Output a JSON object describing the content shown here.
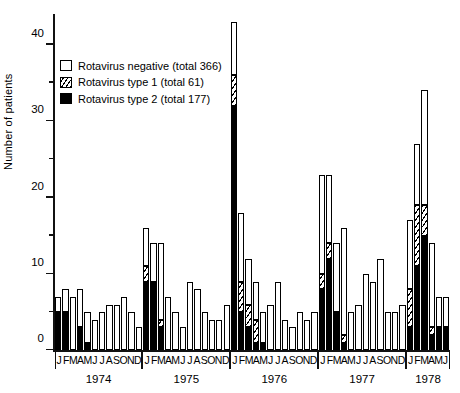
{
  "chart_data": {
    "type": "bar",
    "title": "",
    "stacked": true,
    "xlabel": "",
    "ylabel": "Number of patients",
    "ylim": [
      0,
      44
    ],
    "yticks_major": [
      0,
      10,
      20,
      30,
      40
    ],
    "yticks_minor": [
      5,
      15,
      25,
      35
    ],
    "grid": false,
    "legend_position": "upper-left",
    "month_letters": [
      "J",
      "F",
      "M",
      "A",
      "M",
      "J",
      "J",
      "A",
      "S",
      "O",
      "N",
      "D"
    ],
    "year_groups": [
      {
        "year": "1974",
        "months": [
          "J",
          "F",
          "M",
          "A",
          "M",
          "J",
          "J",
          "A",
          "S",
          "O",
          "N",
          "D"
        ]
      },
      {
        "year": "1975",
        "months": [
          "J",
          "F",
          "M",
          "A",
          "M",
          "J",
          "J",
          "A",
          "S",
          "O",
          "N",
          "D"
        ]
      },
      {
        "year": "1976",
        "months": [
          "J",
          "F",
          "M",
          "A",
          "M",
          "J",
          "J",
          "A",
          "S",
          "O",
          "N",
          "D"
        ]
      },
      {
        "year": "1977",
        "months": [
          "J",
          "F",
          "M",
          "A",
          "M",
          "J",
          "J",
          "A",
          "S",
          "O",
          "N",
          "D"
        ]
      },
      {
        "year": "1978",
        "months": [
          "J",
          "F",
          "M",
          "A",
          "M",
          "J"
        ]
      }
    ],
    "series": [
      {
        "name": "Rotavirus negative",
        "key": "neg",
        "color": "#ffffff",
        "total": 366
      },
      {
        "name": "Rotavirus type 1",
        "key": "t1",
        "color": "hatched",
        "total": 61
      },
      {
        "name": "Rotavirus type 2",
        "key": "t2",
        "color": "#000000",
        "total": 177
      }
    ],
    "x": [
      "1974-01",
      "1974-02",
      "1974-03",
      "1974-04",
      "1974-05",
      "1974-06",
      "1974-07",
      "1974-08",
      "1974-09",
      "1974-10",
      "1974-11",
      "1974-12",
      "1975-01",
      "1975-02",
      "1975-03",
      "1975-04",
      "1975-05",
      "1975-06",
      "1975-07",
      "1975-08",
      "1975-09",
      "1975-10",
      "1975-11",
      "1975-12",
      "1976-01",
      "1976-02",
      "1976-03",
      "1976-04",
      "1976-05",
      "1976-06",
      "1976-07",
      "1976-08",
      "1976-09",
      "1976-10",
      "1976-11",
      "1976-12",
      "1977-01",
      "1977-02",
      "1977-03",
      "1977-04",
      "1977-05",
      "1977-06",
      "1977-07",
      "1977-08",
      "1977-09",
      "1977-10",
      "1977-11",
      "1977-12",
      "1978-01",
      "1978-02",
      "1978-03",
      "1978-04",
      "1978-05",
      "1978-06"
    ],
    "values": {
      "t2": [
        5,
        5,
        0,
        3,
        1,
        0,
        0,
        0,
        0,
        0,
        0,
        0,
        9,
        9,
        3,
        0,
        0,
        0,
        0,
        0,
        0,
        0,
        0,
        0,
        32,
        5,
        3,
        1,
        1,
        0,
        0,
        0,
        0,
        0,
        0,
        0,
        8,
        12,
        5,
        1,
        0,
        0,
        0,
        0,
        0,
        0,
        0,
        0,
        3,
        11,
        15,
        2,
        3,
        3
      ],
      "t1": [
        0,
        0,
        0,
        0,
        0,
        0,
        0,
        0,
        0,
        0,
        0,
        0,
        2,
        0,
        1,
        0,
        0,
        0,
        0,
        0,
        0,
        0,
        0,
        0,
        4,
        4,
        3,
        3,
        0,
        0,
        0,
        0,
        0,
        0,
        0,
        0,
        2,
        2,
        0,
        1,
        0,
        0,
        0,
        0,
        0,
        0,
        0,
        0,
        5,
        8,
        4,
        1,
        0,
        0
      ],
      "neg": [
        2,
        3,
        7,
        5,
        4,
        4,
        5,
        6,
        6,
        7,
        5,
        3,
        5,
        5,
        10,
        7,
        5,
        3,
        9,
        8,
        5,
        4,
        4,
        6,
        7,
        9,
        6,
        5,
        4,
        6,
        9,
        4,
        3,
        5,
        4,
        5,
        13,
        9,
        9,
        14,
        5,
        6,
        10,
        9,
        12,
        5,
        5,
        6,
        9,
        8,
        15,
        11,
        4,
        4
      ]
    },
    "bar_totals": [
      7,
      8,
      7,
      8,
      5,
      4,
      5,
      6,
      6,
      7,
      5,
      3,
      16,
      14,
      14,
      7,
      5,
      3,
      9,
      8,
      5,
      4,
      4,
      6,
      43,
      18,
      12,
      9,
      5,
      6,
      9,
      4,
      3,
      5,
      4,
      5,
      23,
      23,
      14,
      16,
      5,
      6,
      10,
      9,
      12,
      5,
      5,
      6,
      17,
      27,
      34,
      14,
      7,
      7
    ]
  },
  "legend": {
    "items": [
      {
        "label": "Rotavirus negative  (total 366)",
        "swatch": "neg"
      },
      {
        "label": "Rotavirus type 1  (total 61)",
        "swatch": "t1"
      },
      {
        "label": "Rotavirus type 2  (total 177)",
        "swatch": "t2"
      }
    ]
  },
  "axis": {
    "y_label": "Number of patients"
  }
}
